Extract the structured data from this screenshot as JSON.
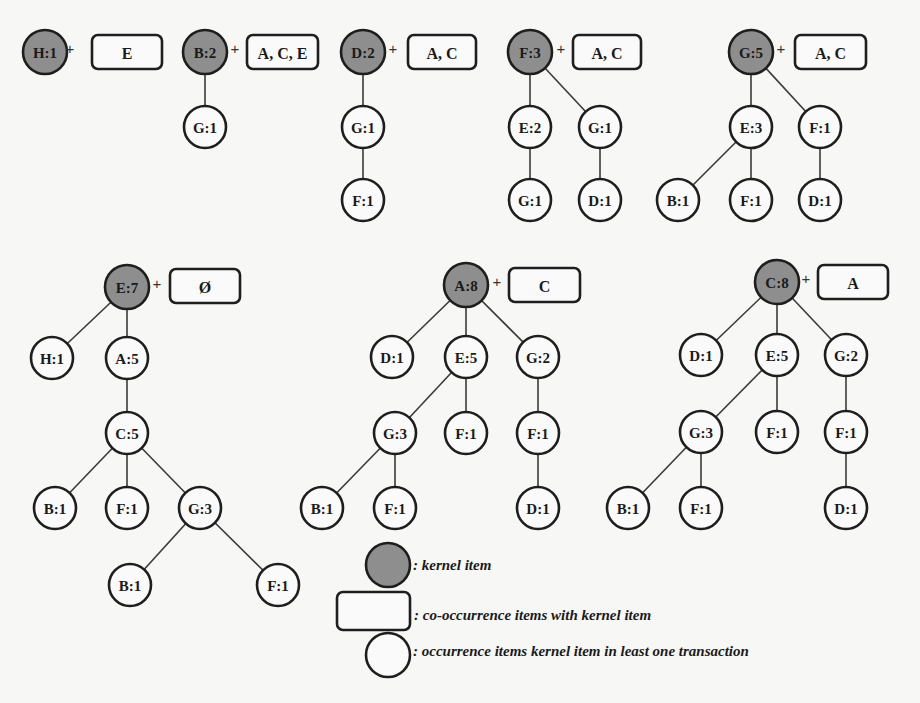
{
  "colors": {
    "kernel_fill": "#8e8e8e",
    "node_fill": "#fafafa",
    "stroke": "#1e1e1e",
    "background": "#f7f7f5"
  },
  "trees": [
    {
      "id": "H",
      "kernel": {
        "label": "H:1",
        "x": 45,
        "y": 52
      },
      "cooccurrence": {
        "label": "E",
        "x": 92,
        "y": 35,
        "w": 70,
        "h": 34
      },
      "plus": {
        "x": 70,
        "y": 48
      },
      "nodes": [],
      "edges": []
    },
    {
      "id": "B",
      "kernel": {
        "label": "B:2",
        "x": 205,
        "y": 52
      },
      "cooccurrence": {
        "label": "A, C, E",
        "x": 247,
        "y": 35,
        "w": 71,
        "h": 34
      },
      "plus": {
        "x": 235,
        "y": 48
      },
      "nodes": [
        {
          "label": "G:1",
          "x": 205,
          "y": 127
        }
      ],
      "edges": [
        [
          205,
          52,
          205,
          127
        ]
      ]
    },
    {
      "id": "D",
      "kernel": {
        "label": "D:2",
        "x": 363,
        "y": 52
      },
      "cooccurrence": {
        "label": "A, C",
        "x": 408,
        "y": 35,
        "w": 68,
        "h": 34
      },
      "plus": {
        "x": 393,
        "y": 48
      },
      "nodes": [
        {
          "label": "G:1",
          "x": 363,
          "y": 127
        },
        {
          "label": "F:1",
          "x": 363,
          "y": 200
        }
      ],
      "edges": [
        [
          363,
          52,
          363,
          127
        ],
        [
          363,
          127,
          363,
          200
        ]
      ]
    },
    {
      "id": "F",
      "kernel": {
        "label": "F:3",
        "x": 530,
        "y": 52
      },
      "cooccurrence": {
        "label": "A, C",
        "x": 573,
        "y": 35,
        "w": 68,
        "h": 34
      },
      "plus": {
        "x": 561,
        "y": 48
      },
      "nodes": [
        {
          "label": "E:2",
          "x": 530,
          "y": 127
        },
        {
          "label": "G:1",
          "x": 600,
          "y": 127
        },
        {
          "label": "G:1",
          "x": 530,
          "y": 200
        },
        {
          "label": "D:1",
          "x": 600,
          "y": 200
        }
      ],
      "edges": [
        [
          530,
          52,
          530,
          127
        ],
        [
          530,
          52,
          600,
          127
        ],
        [
          530,
          127,
          530,
          200
        ],
        [
          600,
          127,
          600,
          200
        ]
      ]
    },
    {
      "id": "G",
      "kernel": {
        "label": "G:5",
        "x": 751,
        "y": 52
      },
      "cooccurrence": {
        "label": "A, C",
        "x": 795,
        "y": 35,
        "w": 71,
        "h": 34
      },
      "plus": {
        "x": 781,
        "y": 48
      },
      "nodes": [
        {
          "label": "E:3",
          "x": 751,
          "y": 127
        },
        {
          "label": "F:1",
          "x": 820,
          "y": 127
        },
        {
          "label": "B:1",
          "x": 678,
          "y": 200
        },
        {
          "label": "F:1",
          "x": 751,
          "y": 200
        },
        {
          "label": "D:1",
          "x": 820,
          "y": 200
        }
      ],
      "edges": [
        [
          751,
          52,
          751,
          127
        ],
        [
          751,
          52,
          820,
          127
        ],
        [
          751,
          127,
          678,
          200
        ],
        [
          751,
          127,
          751,
          200
        ],
        [
          820,
          127,
          820,
          200
        ]
      ]
    },
    {
      "id": "E",
      "kernel": {
        "label": "E:7",
        "x": 127,
        "y": 287
      },
      "cooccurrence": {
        "label": "Ø",
        "x": 170,
        "y": 269,
        "w": 70,
        "h": 34
      },
      "plus": {
        "x": 157,
        "y": 283
      },
      "nodes": [
        {
          "label": "H:1",
          "x": 52,
          "y": 358
        },
        {
          "label": "A:5",
          "x": 127,
          "y": 358
        },
        {
          "label": "C:5",
          "x": 127,
          "y": 433
        },
        {
          "label": "B:1",
          "x": 55,
          "y": 508
        },
        {
          "label": "F:1",
          "x": 127,
          "y": 508
        },
        {
          "label": "G:3",
          "x": 200,
          "y": 508
        },
        {
          "label": "B:1",
          "x": 130,
          "y": 585
        },
        {
          "label": "F:1",
          "x": 278,
          "y": 585
        }
      ],
      "edges": [
        [
          127,
          287,
          52,
          358
        ],
        [
          127,
          287,
          127,
          358
        ],
        [
          127,
          358,
          127,
          433
        ],
        [
          127,
          433,
          55,
          508
        ],
        [
          127,
          433,
          127,
          508
        ],
        [
          127,
          433,
          200,
          508
        ],
        [
          200,
          508,
          130,
          585
        ],
        [
          200,
          508,
          278,
          585
        ]
      ]
    },
    {
      "id": "A",
      "kernel": {
        "label": "A:8",
        "x": 466,
        "y": 285
      },
      "cooccurrence": {
        "label": "C",
        "x": 509,
        "y": 268,
        "w": 71,
        "h": 34
      },
      "plus": {
        "x": 497,
        "y": 281
      },
      "nodes": [
        {
          "label": "D:1",
          "x": 392,
          "y": 357
        },
        {
          "label": "E:5",
          "x": 466,
          "y": 357
        },
        {
          "label": "G:2",
          "x": 538,
          "y": 357
        },
        {
          "label": "G:3",
          "x": 395,
          "y": 433
        },
        {
          "label": "F:1",
          "x": 466,
          "y": 433
        },
        {
          "label": "F:1",
          "x": 538,
          "y": 433
        },
        {
          "label": "B:1",
          "x": 322,
          "y": 508
        },
        {
          "label": "F:1",
          "x": 395,
          "y": 508
        },
        {
          "label": "D:1",
          "x": 538,
          "y": 508
        }
      ],
      "edges": [
        [
          466,
          285,
          392,
          357
        ],
        [
          466,
          285,
          466,
          357
        ],
        [
          466,
          285,
          538,
          357
        ],
        [
          466,
          357,
          395,
          433
        ],
        [
          466,
          357,
          466,
          433
        ],
        [
          538,
          357,
          538,
          433
        ],
        [
          395,
          433,
          322,
          508
        ],
        [
          395,
          433,
          395,
          508
        ],
        [
          538,
          433,
          538,
          508
        ]
      ]
    },
    {
      "id": "C",
      "kernel": {
        "label": "C:8",
        "x": 777,
        "y": 282
      },
      "cooccurrence": {
        "label": "A",
        "x": 818,
        "y": 265,
        "w": 70,
        "h": 34
      },
      "plus": {
        "x": 806,
        "y": 278
      },
      "nodes": [
        {
          "label": "D:1",
          "x": 701,
          "y": 355
        },
        {
          "label": "E:5",
          "x": 777,
          "y": 355
        },
        {
          "label": "G:2",
          "x": 846,
          "y": 355
        },
        {
          "label": "G:3",
          "x": 701,
          "y": 432
        },
        {
          "label": "F:1",
          "x": 777,
          "y": 432
        },
        {
          "label": "F:1",
          "x": 846,
          "y": 432
        },
        {
          "label": "B:1",
          "x": 628,
          "y": 508
        },
        {
          "label": "F:1",
          "x": 701,
          "y": 508
        },
        {
          "label": "D:1",
          "x": 846,
          "y": 508
        }
      ],
      "edges": [
        [
          777,
          282,
          701,
          355
        ],
        [
          777,
          282,
          777,
          355
        ],
        [
          777,
          282,
          846,
          355
        ],
        [
          777,
          355,
          701,
          432
        ],
        [
          777,
          355,
          777,
          432
        ],
        [
          846,
          355,
          846,
          432
        ],
        [
          701,
          432,
          628,
          508
        ],
        [
          701,
          432,
          701,
          508
        ],
        [
          846,
          432,
          846,
          508
        ]
      ]
    }
  ],
  "plus_symbol": "+",
  "legend": {
    "kernel": {
      "text": ": kernel item",
      "x": 388,
      "y": 565
    },
    "cooccurrence": {
      "text": ": co-occurrence items with kernel item",
      "x": 337,
      "y": 592,
      "w": 73,
      "h": 38
    },
    "occurrence": {
      "text": ": occurrence items kernel item in least one transaction",
      "x": 388,
      "y": 655
    }
  }
}
